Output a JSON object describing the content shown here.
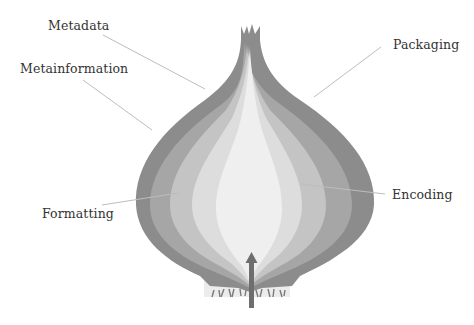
{
  "diagram": {
    "type": "onion-layers",
    "colors": {
      "outer_layer": "#8c8c8c",
      "layer_2": "#a6a6a6",
      "layer_3": "#c4c4c4",
      "layer_4": "#dddddd",
      "core": "#efefef",
      "leader_line": "#bdbdbd",
      "arrow": "#6e6e6e",
      "base": "#ececec"
    },
    "labels": {
      "metadata": "Metadata",
      "metainformation": "Metainformation",
      "packaging": "Packaging",
      "formatting": "Formatting",
      "encoding": "Encoding"
    }
  }
}
